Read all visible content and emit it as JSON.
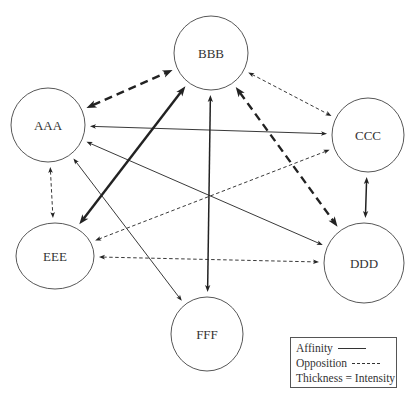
{
  "diagram": {
    "nodes": [
      {
        "id": "AAA",
        "label": "AAA",
        "cx": 48,
        "cy": 125,
        "rx": 37,
        "ry": 37
      },
      {
        "id": "BBB",
        "label": "BBB",
        "cx": 211,
        "cy": 53,
        "rx": 37,
        "ry": 37
      },
      {
        "id": "CCC",
        "label": "CCC",
        "cx": 368,
        "cy": 135,
        "rx": 36,
        "ry": 37
      },
      {
        "id": "DDD",
        "label": "DDD",
        "cx": 364,
        "cy": 263,
        "rx": 40,
        "ry": 40
      },
      {
        "id": "EEE",
        "label": "EEE",
        "cx": 55,
        "cy": 256,
        "rx": 39,
        "ry": 33
      },
      {
        "id": "FFF",
        "label": "FFF",
        "cx": 207,
        "cy": 334,
        "rx": 36,
        "ry": 37
      }
    ],
    "edges": [
      {
        "from": "AAA",
        "to": "BBB",
        "type": "opposition",
        "intensity": "high",
        "bidirectional": true
      },
      {
        "from": "BBB",
        "to": "CCC",
        "type": "opposition",
        "intensity": "low",
        "bidirectional": true
      },
      {
        "from": "AAA",
        "to": "CCC",
        "type": "affinity",
        "intensity": "low",
        "bidirectional": true
      },
      {
        "from": "AAA",
        "to": "DDD",
        "type": "affinity",
        "intensity": "low",
        "bidirectional": true
      },
      {
        "from": "BBB",
        "to": "EEE",
        "type": "affinity",
        "intensity": "high",
        "bidirectional": true
      },
      {
        "from": "BBB",
        "to": "FFF",
        "type": "affinity",
        "intensity": "medium",
        "bidirectional": true
      },
      {
        "from": "BBB",
        "to": "DDD",
        "type": "opposition",
        "intensity": "high",
        "bidirectional": true
      },
      {
        "from": "CCC",
        "to": "EEE",
        "type": "opposition",
        "intensity": "low",
        "bidirectional": true
      },
      {
        "from": "CCC",
        "to": "DDD",
        "type": "affinity",
        "intensity": "medium",
        "bidirectional": true
      },
      {
        "from": "AAA",
        "to": "EEE",
        "type": "opposition",
        "intensity": "low",
        "bidirectional": true
      },
      {
        "from": "EEE",
        "to": "DDD",
        "type": "opposition",
        "intensity": "low",
        "bidirectional": true
      },
      {
        "from": "AAA",
        "to": "FFF",
        "type": "affinity",
        "intensity": "low",
        "bidirectional": true
      }
    ],
    "colors": {
      "stroke": "#222222",
      "node_stroke": "#444444",
      "text": "#333333"
    }
  },
  "legend": {
    "affinity_label": "Affinity",
    "opposition_label": "Opposition",
    "thickness_label": "Thickness = Intensity"
  }
}
